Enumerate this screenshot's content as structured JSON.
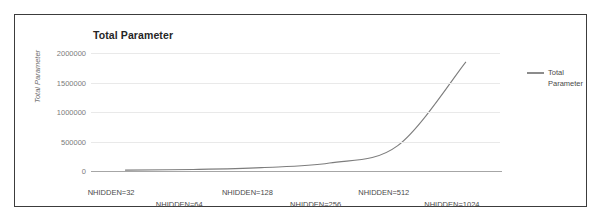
{
  "chart": {
    "title": "Total Parameter",
    "legend": {
      "entry": "Total Parameter",
      "position": "right",
      "swatch_color": "#8c8c8c"
    },
    "axes": {
      "ylabel": "Total Parameter",
      "xlabel": "",
      "yticks": [
        "0",
        "500000",
        "1000000",
        "1500000",
        "2000000"
      ],
      "xticks": [
        "NHIDDEN=32",
        "NHIDDEN=64",
        "NHIDDEN=128",
        "NHIDDEN=256",
        "NHIDDEN=512",
        "NHIDDEN=1024"
      ]
    },
    "colors": {
      "line": "#7d7d7d",
      "grid": "#e9e9e9",
      "axis": "#a6a6a6",
      "border": "#3c3c3c",
      "background": "#ffffff"
    }
  },
  "chart_data": {
    "type": "line",
    "title": "Total Parameter",
    "xlabel": "",
    "ylabel": "Total Parameter",
    "categories": [
      "NHIDDEN=32",
      "NHIDDEN=64",
      "NHIDDEN=128",
      "NHIDDEN=256",
      "NHIDDEN=512",
      "NHIDDEN=1024"
    ],
    "series": [
      {
        "name": "Total Parameter",
        "values": [
          14000,
          26000,
          58000,
          135000,
          430000,
          1850000
        ]
      }
    ],
    "ylim": [
      0,
      2000000
    ],
    "ytick_values": [
      0,
      500000,
      1000000,
      1500000,
      2000000
    ],
    "grid": true,
    "legend_position": "right"
  }
}
